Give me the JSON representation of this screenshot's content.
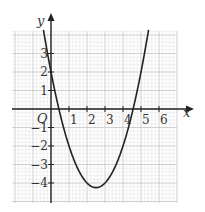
{
  "chart_data": {
    "type": "line",
    "title": "",
    "xlabel": "x",
    "ylabel": "y",
    "origin_label": "O",
    "xlim": [
      -2.1,
      7.0
    ],
    "ylim": [
      -5.1,
      4.2
    ],
    "x_ticks": [
      1,
      2,
      3,
      4,
      5,
      6
    ],
    "y_ticks": [
      3,
      2,
      1,
      -1,
      -2,
      -3,
      -4
    ],
    "grid": true,
    "minor_grid_step": 0.2,
    "series": [
      {
        "name": "y = x^2 - 5x + 2",
        "equation": "x^2 - 5x + 2",
        "color": "#222222",
        "points": [
          [
            -0.45,
            4.45
          ],
          [
            0,
            2
          ],
          [
            0.44,
            0
          ],
          [
            1,
            -2
          ],
          [
            1.5,
            -3.25
          ],
          [
            2,
            -4
          ],
          [
            2.5,
            -4.25
          ],
          [
            3,
            -4
          ],
          [
            3.5,
            -3.25
          ],
          [
            4,
            -2
          ],
          [
            4.56,
            0
          ],
          [
            5,
            2
          ],
          [
            5.4,
            4.16
          ]
        ]
      }
    ],
    "features": {
      "y_intercept": 2,
      "roots": [
        0.44,
        4.56
      ],
      "vertex": [
        2.5,
        -4.25
      ]
    }
  },
  "labels": {
    "x": "x",
    "y": "y",
    "origin": "O",
    "xticks": [
      "1",
      "2",
      "3",
      "4",
      "5",
      "6"
    ],
    "yticks": [
      "3",
      "2",
      "1",
      "−1",
      "−2",
      "−3",
      "−4"
    ]
  },
  "colors": {
    "grid_minor": "#e2e2e2",
    "grid_major": "#c4c4c4",
    "axis": "#222222",
    "curve": "#222222"
  }
}
